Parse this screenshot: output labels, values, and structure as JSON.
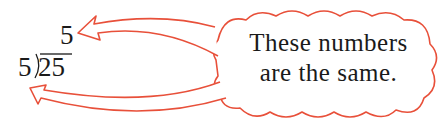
{
  "division": {
    "quotient": "5",
    "divisor": "5",
    "dividend": "25"
  },
  "callout": {
    "line1": "These numbers",
    "line2": "are the same."
  },
  "colors": {
    "outline": "#e8503a",
    "text": "#1a1a1a",
    "background": "#ffffff"
  },
  "icons": {
    "arrow_to_quotient": "curved-arrow-icon",
    "arrow_to_divisor": "curved-arrow-icon",
    "cloud": "thought-cloud"
  }
}
